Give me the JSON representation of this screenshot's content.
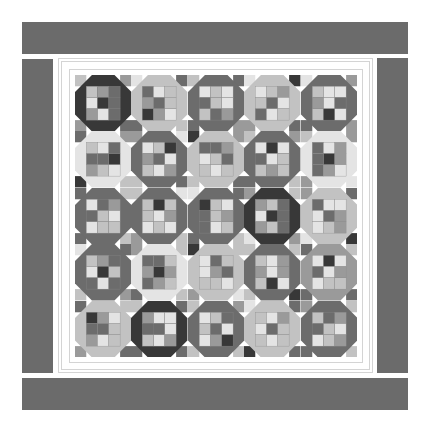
{
  "palette": {
    "D": "#383838",
    "M": "#6c6c6c",
    "G": "#9a9a9a",
    "L": "#c2c2c2",
    "W": "#e4e4e4",
    "border": "#6b6b6b",
    "frame_line": "#d4d4d4"
  },
  "grid": {
    "rows": 5,
    "cols": 5
  },
  "blocks": [
    [
      {
        "octagon": "D",
        "corners": [
          "L",
          "G",
          "G",
          "M"
        ],
        "nine": [
          "L",
          "G",
          "M",
          "W",
          "D",
          "M",
          "G",
          "W",
          "M"
        ]
      },
      {
        "octagon": "L",
        "corners": [
          "W",
          "M",
          "M",
          "L"
        ],
        "nine": [
          "M",
          "W",
          "L",
          "G",
          "M",
          "L",
          "D",
          "G",
          "W"
        ]
      },
      {
        "octagon": "M",
        "corners": [
          "L",
          "M",
          "M",
          "G"
        ],
        "nine": [
          "W",
          "L",
          "W",
          "M",
          "L",
          "W",
          "L",
          "M",
          "G"
        ]
      },
      {
        "octagon": "L",
        "corners": [
          "W",
          "D",
          "G",
          "M"
        ],
        "nine": [
          "W",
          "L",
          "G",
          "L",
          "M",
          "W",
          "M",
          "W",
          "L"
        ]
      },
      {
        "octagon": "M",
        "corners": [
          "W",
          "G",
          "M",
          "G"
        ],
        "nine": [
          "L",
          "W",
          "W",
          "G",
          "W",
          "M",
          "L",
          "D",
          "W"
        ]
      }
    ],
    [
      {
        "octagon": "W",
        "corners": [
          "M",
          "G",
          "D",
          "L"
        ],
        "nine": [
          "L",
          "W",
          "M",
          "M",
          "M",
          "D",
          "G",
          "L",
          "W"
        ]
      },
      {
        "octagon": "M",
        "corners": [
          "G",
          "W",
          "L",
          "M"
        ],
        "nine": [
          "W",
          "L",
          "D",
          "G",
          "M",
          "W",
          "L",
          "W",
          "G"
        ]
      },
      {
        "octagon": "L",
        "corners": [
          "D",
          "G",
          "L",
          "M"
        ],
        "nine": [
          "M",
          "M",
          "G",
          "W",
          "L",
          "M",
          "L",
          "W",
          "L"
        ]
      },
      {
        "octagon": "M",
        "corners": [
          "L",
          "G",
          "M",
          "L"
        ],
        "nine": [
          "W",
          "D",
          "W",
          "M",
          "W",
          "L",
          "L",
          "G",
          "L"
        ]
      },
      {
        "octagon": "W",
        "corners": [
          "L",
          "G",
          "G",
          "W"
        ],
        "nine": [
          "M",
          "W",
          "G",
          "M",
          "D",
          "G",
          "M",
          "G",
          "W"
        ]
      }
    ],
    [
      {
        "octagon": "M",
        "corners": [
          "M",
          "L",
          "M",
          "L"
        ],
        "nine": [
          "W",
          "M",
          "G",
          "M",
          "L",
          "W",
          "W",
          "L",
          "L"
        ]
      },
      {
        "octagon": "M",
        "corners": [
          "L",
          "W",
          "G",
          "L"
        ],
        "nine": [
          "L",
          "D",
          "L",
          "L",
          "W",
          "G",
          "W",
          "L",
          "W"
        ]
      },
      {
        "octagon": "M",
        "corners": [
          "W",
          "M",
          "M",
          "L"
        ],
        "nine": [
          "D",
          "L",
          "W",
          "M",
          "L",
          "G",
          "M",
          "W",
          "L"
        ]
      },
      {
        "octagon": "D",
        "corners": [
          "G",
          "L",
          "W",
          "G"
        ],
        "nine": [
          "G",
          "L",
          "M",
          "W",
          "D",
          "M",
          "G",
          "L",
          "M"
        ]
      },
      {
        "octagon": "L",
        "corners": [
          "G",
          "M",
          "W",
          "D"
        ],
        "nine": [
          "M",
          "W",
          "W",
          "W",
          "M",
          "G",
          "W",
          "L",
          "G"
        ]
      }
    ],
    [
      {
        "octagon": "M",
        "corners": [
          "W",
          "M",
          "L",
          "G"
        ],
        "nine": [
          "L",
          "G",
          "M",
          "W",
          "D",
          "L",
          "M",
          "W",
          "M"
        ]
      },
      {
        "octagon": "W",
        "corners": [
          "G",
          "L",
          "M",
          "L"
        ],
        "nine": [
          "M",
          "M",
          "L",
          "G",
          "D",
          "G",
          "M",
          "G",
          "L"
        ]
      },
      {
        "octagon": "L",
        "corners": [
          "D",
          "L",
          "G",
          "W"
        ],
        "nine": [
          "W",
          "M",
          "L",
          "W",
          "G",
          "M",
          "L",
          "L",
          "W"
        ]
      },
      {
        "octagon": "M",
        "corners": [
          "L",
          "L",
          "L",
          "D"
        ],
        "nine": [
          "L",
          "W",
          "G",
          "G",
          "W",
          "G",
          "L",
          "D",
          "W"
        ]
      },
      {
        "octagon": "G",
        "corners": [
          "M",
          "L",
          "M",
          "M"
        ],
        "nine": [
          "W",
          "D",
          "W",
          "M",
          "W",
          "G",
          "W",
          "L",
          "L"
        ]
      }
    ],
    [
      {
        "octagon": "L",
        "corners": [
          "M",
          "L",
          "G",
          "M"
        ],
        "nine": [
          "D",
          "G",
          "W",
          "M",
          "M",
          "L",
          "G",
          "W",
          "L"
        ]
      },
      {
        "octagon": "D",
        "corners": [
          "L",
          "M",
          "M",
          "M"
        ],
        "nine": [
          "G",
          "W",
          "W",
          "M",
          "M",
          "W",
          "L",
          "W",
          "G"
        ]
      },
      {
        "octagon": "M",
        "corners": [
          "L",
          "G",
          "L",
          "L"
        ],
        "nine": [
          "W",
          "L",
          "M",
          "L",
          "M",
          "W",
          "W",
          "G",
          "D"
        ]
      },
      {
        "octagon": "L",
        "corners": [
          "W",
          "M",
          "D",
          "M"
        ],
        "nine": [
          "L",
          "W",
          "G",
          "W",
          "M",
          "L",
          "L",
          "W",
          "L"
        ]
      },
      {
        "octagon": "M",
        "corners": [
          "G",
          "L",
          "M",
          "L"
        ],
        "nine": [
          "L",
          "M",
          "G",
          "M",
          "L",
          "W",
          "W",
          "L",
          "G"
        ]
      }
    ]
  ]
}
